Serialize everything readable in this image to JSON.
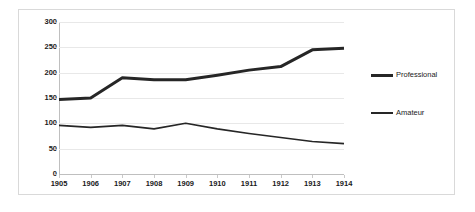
{
  "chart_data": {
    "type": "line",
    "title": "",
    "xlabel": "",
    "ylabel": "",
    "categories": [
      "1905",
      "1906",
      "1907",
      "1908",
      "1909",
      "1910",
      "1911",
      "1912",
      "1913",
      "1914"
    ],
    "series": [
      {
        "name": "Professional",
        "values": [
          147,
          150,
          190,
          186,
          186,
          195,
          205,
          212,
          245,
          248
        ],
        "color": "#262626",
        "line_width": 3
      },
      {
        "name": "Amateur",
        "values": [
          96,
          92,
          96,
          89,
          100,
          89,
          80,
          72,
          64,
          60
        ],
        "color": "#262626",
        "line_width": 1.6
      }
    ],
    "ylim": [
      0,
      300
    ],
    "yticks": [
      0,
      50,
      100,
      150,
      200,
      250,
      300
    ],
    "ytick_labels": [
      "0",
      "50",
      "100",
      "150",
      "200",
      "250",
      "300"
    ],
    "grid": true,
    "grid_color": "#e8e8e8",
    "legend_position": "right",
    "axis_color": "#bfbfbf",
    "border_color": "#d9d9d9",
    "background": "#ffffff"
  }
}
